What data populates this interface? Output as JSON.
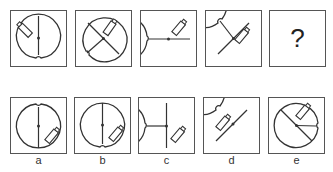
{
  "puzzle": {
    "type": "figure-sequence-reasoning",
    "question_row": [
      {
        "id": "q1",
        "description": "circle with vertical line, notch at bottom, battery upper-left"
      },
      {
        "id": "q2",
        "description": "circle with X lines, notch at lower-left, battery upper-right"
      },
      {
        "id": "q3",
        "description": "circle with horizontal line, notch at left, battery upper-right"
      },
      {
        "id": "q4",
        "description": "circle with diagonal lines, notch at upper-left, battery right of center"
      },
      {
        "id": "q5",
        "placeholder": "?"
      }
    ],
    "options": [
      {
        "label": "a",
        "description": "vertical line, notch at top, battery lower-right"
      },
      {
        "label": "b",
        "description": "vertical line, notch at bottom, battery lower-right"
      },
      {
        "label": "c",
        "description": "vertical plus left horizontal line, notch at left, battery lower-right"
      },
      {
        "label": "d",
        "description": "diagonal line, notch upper-left, battery left of center"
      },
      {
        "label": "e",
        "description": "diagonal plus right line, notch at right, battery upper-right"
      }
    ]
  },
  "colors": {
    "stroke": "#333333",
    "border": "#555555"
  }
}
